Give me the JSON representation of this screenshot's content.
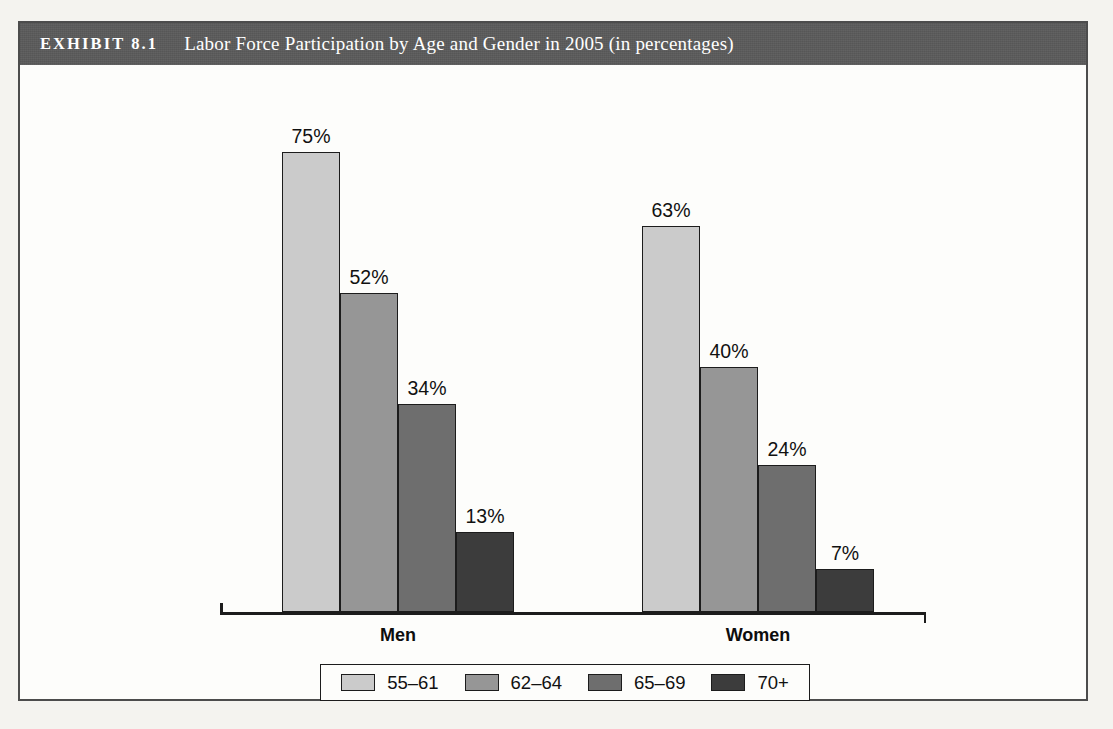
{
  "exhibit": {
    "tag": "EXHIBIT 8.1",
    "title": "Labor Force Participation by Age and Gender in 2005 (in percentages)",
    "header_bg": "#5b5b5b",
    "frame_border": "#4c4c4c",
    "page_bg": "#f4f3ef"
  },
  "chart_data": {
    "type": "bar",
    "title": "Labor Force Participation by Age and Gender in 2005 (in percentages)",
    "xlabel": "",
    "ylabel": "",
    "ylim": [
      0,
      75
    ],
    "grid": false,
    "legend_position": "bottom",
    "categories": [
      "Men",
      "Women"
    ],
    "series": [
      {
        "name": "55–61",
        "values": [
          75,
          63
        ],
        "color": "#cbcbcb",
        "labels": [
          "75%",
          "63%"
        ]
      },
      {
        "name": "62–64",
        "values": [
          52,
          40
        ],
        "color": "#969696",
        "labels": [
          "52%",
          "40%"
        ]
      },
      {
        "name": "65–69",
        "values": [
          34,
          24
        ],
        "color": "#6e6e6e",
        "labels": [
          "34%",
          "24%"
        ]
      },
      {
        "name": "70+",
        "values": [
          13,
          7
        ],
        "color": "#3c3c3c",
        "labels": [
          "13%",
          "7%"
        ]
      }
    ],
    "value_suffix": "%"
  },
  "legend": {
    "items": [
      {
        "label": "55–61",
        "color": "#cbcbcb"
      },
      {
        "label": "62–64",
        "color": "#969696"
      },
      {
        "label": "65–69",
        "color": "#6e6e6e"
      },
      {
        "label": "70+",
        "color": "#3c3c3c"
      }
    ]
  },
  "axis": {
    "men_label": "Men",
    "women_label": "Women"
  }
}
